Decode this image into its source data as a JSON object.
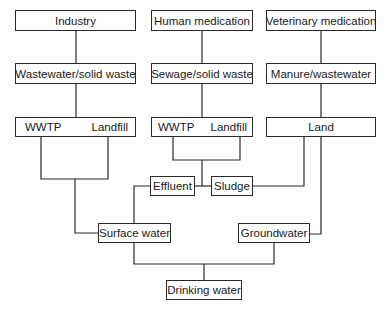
{
  "diagram": {
    "type": "flowchart",
    "nodes": {
      "industry": "Industry",
      "human_medication": "Human medication",
      "veterinary_medication": "Veterinary medication",
      "wastewater_solid_waste": "Wastewater/solid waste",
      "sewage_solid_waste": "Sewage/solid waste",
      "manure_wastewater": "Manure/wastewater",
      "wwtp_1": "WWTP",
      "landfill_1": "Landfill",
      "wwtp_2": "WWTP",
      "landfill_2": "Landfill",
      "land": "Land",
      "effluent": "Effluent",
      "sludge": "Sludge",
      "surface_water": "Surface water",
      "groundwater": "Groundwater",
      "drinking_water": "Drinking water"
    },
    "edges": [
      [
        "Industry",
        "Wastewater/solid waste"
      ],
      [
        "Human medication",
        "Sewage/solid waste"
      ],
      [
        "Veterinary medication",
        "Manure/wastewater"
      ],
      [
        "Wastewater/solid waste",
        "WWTP | Landfill"
      ],
      [
        "Sewage/solid waste",
        "WWTP | Landfill"
      ],
      [
        "Manure/wastewater",
        "Land"
      ],
      [
        "WWTP | Landfill (industry)",
        "Surface water"
      ],
      [
        "WWTP | Landfill (human)",
        "Effluent"
      ],
      [
        "WWTP | Landfill (human)",
        "Sludge"
      ],
      [
        "Effluent",
        "Surface water"
      ],
      [
        "Land",
        "Sludge"
      ],
      [
        "Land",
        "Groundwater"
      ],
      [
        "Surface water",
        "Drinking water"
      ],
      [
        "Groundwater",
        "Drinking water"
      ]
    ]
  }
}
